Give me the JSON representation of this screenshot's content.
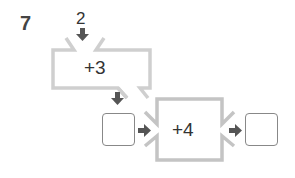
{
  "problem": {
    "number": "7",
    "start_value": "2",
    "machines": [
      {
        "label": "+3"
      },
      {
        "label": "+4"
      }
    ],
    "answer_boxes": [
      {
        "value": ""
      },
      {
        "value": ""
      }
    ]
  },
  "colors": {
    "machine_border": "#c8c8c8",
    "arrow": "#555555",
    "box_border": "#888888",
    "text": "#333333"
  }
}
